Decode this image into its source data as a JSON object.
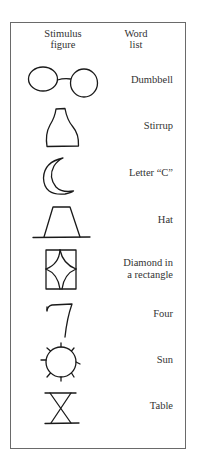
{
  "headers": {
    "stimulus_line1": "Stimulus",
    "stimulus_line2": "figure",
    "word_line1": "Word",
    "word_line2": "list"
  },
  "items": [
    {
      "figure": "dumbbell-figure",
      "word": "Dumbbell"
    },
    {
      "figure": "bottle-figure",
      "word": "Stirrup"
    },
    {
      "figure": "crescent-figure",
      "word": "Letter “C”"
    },
    {
      "figure": "trapezoid-figure",
      "word": "Hat"
    },
    {
      "figure": "diamond-rectangle-figure",
      "word_line1": "Diamond in",
      "word_line2": "a rectangle"
    },
    {
      "figure": "seven-figure",
      "word": "Four"
    },
    {
      "figure": "sun-figure",
      "word": "Sun"
    },
    {
      "figure": "hourglass-figure",
      "word": "Table"
    }
  ]
}
